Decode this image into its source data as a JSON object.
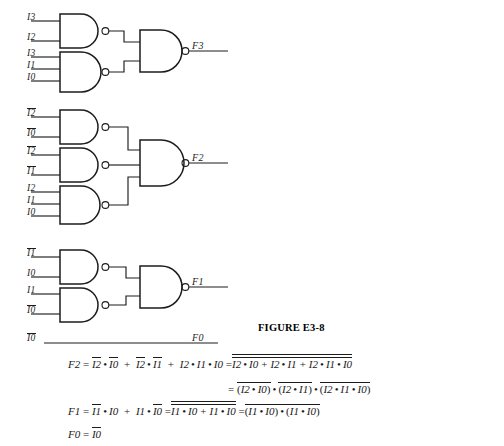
{
  "figure": {
    "caption": "FIGURE E3-8",
    "caption_x": 258,
    "caption_y": 322,
    "background": "#ffffff",
    "ink": "#1c1c1c"
  },
  "circuit": {
    "gate_type": "nand",
    "groups": [
      {
        "name": "F3",
        "output_label": "F3",
        "output_x": 186,
        "output_y": 45,
        "output_gate": {
          "x": 140,
          "y": 30,
          "w": 42,
          "h": 42,
          "inputs": 2
        },
        "input_gates": [
          {
            "x": 60,
            "y": 14,
            "w": 42,
            "h": 34,
            "inputs": [
              {
                "label": "I3",
                "overline": false,
                "lx": 30,
                "ly": 14
              },
              {
                "label": "I2",
                "overline": false,
                "lx": 30,
                "ly": 29
              }
            ]
          },
          {
            "x": 60,
            "y": 52,
            "w": 42,
            "h": 40,
            "inputs": [
              {
                "label": "I3",
                "overline": false,
                "lx": 30,
                "ly": 49
              },
              {
                "label": "I1",
                "overline": false,
                "lx": 30,
                "ly": 61
              },
              {
                "label": "I0",
                "overline": false,
                "lx": 30,
                "ly": 73
              }
            ]
          }
        ]
      },
      {
        "name": "F2",
        "output_label": "F2",
        "output_x": 186,
        "output_y": 160,
        "output_gate": {
          "x": 140,
          "y": 140,
          "w": 42,
          "h": 46,
          "inputs": 3
        },
        "input_gates": [
          {
            "x": 60,
            "y": 110,
            "w": 42,
            "h": 34,
            "inputs": [
              {
                "label": "I2",
                "overline": true,
                "lx": 30,
                "ly": 110
              },
              {
                "label": "I0",
                "overline": true,
                "lx": 30,
                "ly": 126
              }
            ]
          },
          {
            "x": 60,
            "y": 148,
            "w": 42,
            "h": 34,
            "inputs": [
              {
                "label": "I2",
                "overline": true,
                "lx": 30,
                "ly": 148
              },
              {
                "label": "I1",
                "overline": true,
                "lx": 30,
                "ly": 164
              }
            ]
          },
          {
            "x": 60,
            "y": 186,
            "w": 42,
            "h": 38,
            "inputs": [
              {
                "label": "I2",
                "overline": false,
                "lx": 30,
                "ly": 185
              },
              {
                "label": "I1",
                "overline": false,
                "lx": 30,
                "ly": 197
              },
              {
                "label": "I0",
                "overline": false,
                "lx": 30,
                "ly": 209
              }
            ]
          }
        ]
      },
      {
        "name": "F1",
        "output_label": "F1",
        "output_x": 186,
        "output_y": 281,
        "output_gate": {
          "x": 140,
          "y": 266,
          "w": 42,
          "h": 42,
          "inputs": 2
        },
        "input_gates": [
          {
            "x": 60,
            "y": 250,
            "w": 42,
            "h": 34,
            "inputs": [
              {
                "label": "I1",
                "overline": true,
                "lx": 30,
                "ly": 250
              },
              {
                "label": "I0",
                "overline": false,
                "lx": 30,
                "ly": 265
              }
            ]
          },
          {
            "x": 60,
            "y": 288,
            "w": 42,
            "h": 34,
            "inputs": [
              {
                "label": "I1",
                "overline": false,
                "lx": 30,
                "ly": 286
              },
              {
                "label": "I0",
                "overline": true,
                "lx": 30,
                "ly": 300
              }
            ]
          }
        ]
      },
      {
        "name": "F0",
        "output_label": "F0",
        "output_x": 196,
        "output_y": 335,
        "wire": {
          "x1": 46,
          "y1": 343,
          "x2": 213,
          "y2": 343
        },
        "input_gates": [],
        "inputs": [
          {
            "label": "I0",
            "overline": true,
            "lx": 27,
            "ly": 334
          }
        ]
      }
    ]
  },
  "equations": [
    {
      "name": "eq-f2-line1",
      "x": 68,
      "lhs": "F2",
      "terms_sop": [
        {
          "a": "I2",
          "a_bar": true,
          "b": "I0",
          "b_bar": true
        },
        {
          "a": "I2",
          "a_bar": true,
          "b": "I1",
          "b_bar": true
        },
        {
          "a": "I2",
          "a_bar": false,
          "b": "I1",
          "b_bar": false,
          "c": "I0",
          "c_bar": false
        }
      ],
      "sop_text": "F2 = I2̅ · I0̅ + I2̅ · I1̅ + I2 · I1 · I0",
      "double_neg_text": "= I2̅ · I0̅ + I2̅ · I1̅ + I2 · I1 · I0 (double complemented)"
    },
    {
      "name": "eq-f2-line2",
      "x": 228,
      "text": "= (I2̅ · I0̅) · (I2̅ · I1̅) · (I2 · I1 · I0) all complemented"
    },
    {
      "name": "eq-f1",
      "x": 68,
      "lhs": "F1",
      "text": "F1 = I1̅ · I0 + I1 · I0̅ = (I1̅ · I0) · (I1 · I0̅) complemented"
    },
    {
      "name": "eq-f0",
      "x": 68,
      "lhs": "F0",
      "text": "F0 = I0̅"
    }
  ],
  "symbols": {
    "equals": "=",
    "plus": "+",
    "dot": "•",
    "lparen": "(",
    "rparen": ")",
    "F2": "F2",
    "F1": "F1",
    "F0": "F0",
    "F3": "F3",
    "I0": "I0",
    "I1": "I1",
    "I2": "I2",
    "I3": "I3"
  }
}
